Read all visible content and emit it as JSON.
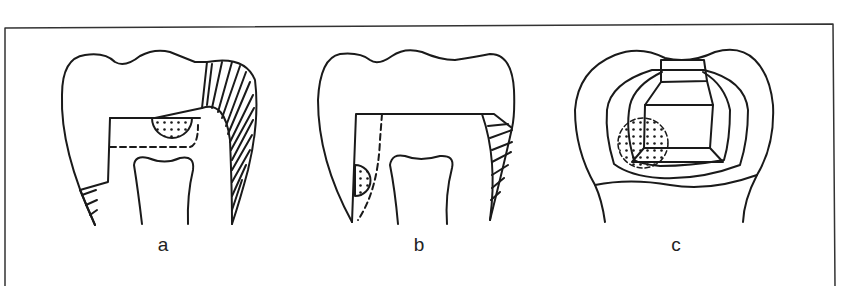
{
  "figure": {
    "panels": [
      {
        "id": "a",
        "label": "a",
        "label_x": 163,
        "label_y": 234
      },
      {
        "id": "b",
        "label": "b",
        "label_x": 419,
        "label_y": 234
      },
      {
        "id": "c",
        "label": "c",
        "label_x": 676,
        "label_y": 234
      }
    ],
    "colors": {
      "stroke": "#1a1a1a",
      "background": "#ffffff",
      "frame": "#333333"
    }
  }
}
